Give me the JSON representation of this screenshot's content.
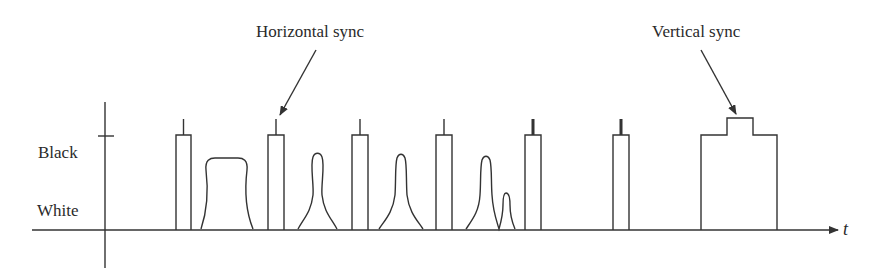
{
  "figure": {
    "y_levels": {
      "black": "Black",
      "white": "White"
    },
    "x_axis_label": "t",
    "annotations": {
      "horizontal_sync": "Horizontal sync",
      "vertical_sync": "Vertical sync"
    },
    "colors": {
      "stroke": "#333333",
      "text": "#2a2a2a",
      "background": "#ffffff"
    },
    "elements": [
      {
        "type": "sync-pulse",
        "x": 176
      },
      {
        "type": "video-line",
        "shape": "broad"
      },
      {
        "type": "sync-pulse",
        "x": 268
      },
      {
        "type": "video-line",
        "shape": "narrow-peak"
      },
      {
        "type": "sync-pulse",
        "x": 352
      },
      {
        "type": "video-line",
        "shape": "sharp-peak"
      },
      {
        "type": "sync-pulse",
        "x": 436
      },
      {
        "type": "video-line",
        "shape": "double-peak"
      },
      {
        "type": "sync-pulse",
        "x": 525,
        "spike": "thick"
      },
      {
        "type": "sync-pulse",
        "x": 613,
        "spike": "thick"
      },
      {
        "type": "vertical-sync-block",
        "x": 701
      }
    ]
  }
}
